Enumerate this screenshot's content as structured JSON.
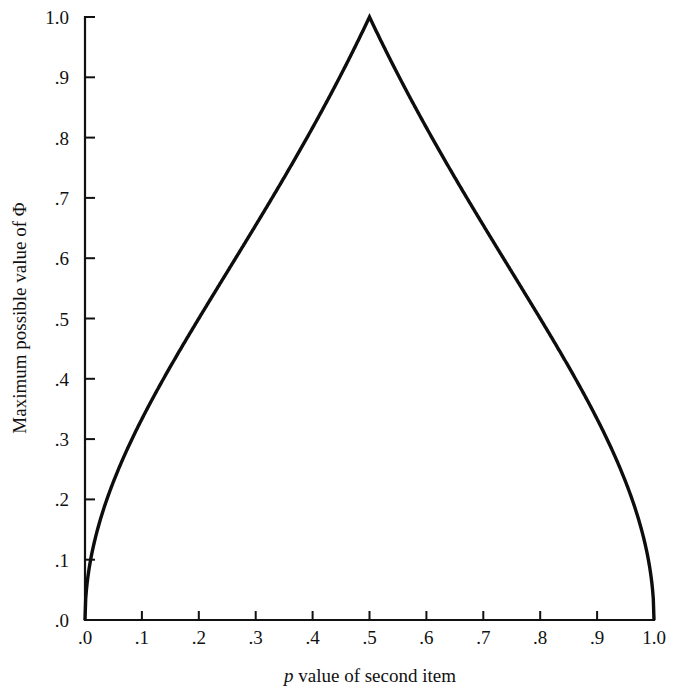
{
  "figure": {
    "background_color": "#ffffff",
    "line_color": "#0d0d0d",
    "axis_color": "#111111"
  },
  "chart_data": {
    "type": "line",
    "title": "",
    "xlabel": "p value of second item",
    "xlabel_italic_prefix": "p",
    "xlabel_rest": " value of second item",
    "ylabel": "Maximum possible value of Φ",
    "ylabel_text": "Maximum possible value of",
    "ylabel_symbol": "Φ",
    "xlim": [
      0.0,
      1.0
    ],
    "ylim": [
      0.0,
      1.0
    ],
    "grid": false,
    "legend": "none",
    "xticks": [
      0.0,
      0.1,
      0.2,
      0.3,
      0.4,
      0.5,
      0.6,
      0.7,
      0.8,
      0.9,
      1.0
    ],
    "xticklabels": [
      ".0",
      ".1",
      ".2",
      ".3",
      ".4",
      ".5",
      ".6",
      ".7",
      ".8",
      ".9",
      "1.0"
    ],
    "yticks": [
      0.0,
      0.1,
      0.2,
      0.3,
      0.4,
      0.5,
      0.6,
      0.7,
      0.8,
      0.9,
      1.0
    ],
    "yticklabels": [
      ".0",
      ".1",
      ".2",
      ".3",
      ".4",
      ".5",
      ".6",
      ".7",
      ".8",
      ".9",
      "1.0"
    ],
    "series": [
      {
        "name": "Maximum possible phi",
        "formula": "sqrt(p/(1-p)) for p<=0.5 ; sqrt((1-p)/p) for p>0.5",
        "x": [
          0.0,
          0.01,
          0.02,
          0.03,
          0.04,
          0.05,
          0.06,
          0.08,
          0.1,
          0.12,
          0.15,
          0.2,
          0.25,
          0.3,
          0.35,
          0.4,
          0.45,
          0.5,
          0.55,
          0.6,
          0.65,
          0.7,
          0.75,
          0.8,
          0.85,
          0.88,
          0.9,
          0.92,
          0.94,
          0.95,
          0.96,
          0.97,
          0.98,
          0.99,
          1.0
        ],
        "y": [
          0.0,
          0.101,
          0.143,
          0.176,
          0.204,
          0.229,
          0.253,
          0.295,
          0.333,
          0.369,
          0.42,
          0.5,
          0.577,
          0.655,
          0.734,
          0.816,
          0.905,
          1.0,
          0.905,
          0.816,
          0.734,
          0.655,
          0.577,
          0.5,
          0.42,
          0.369,
          0.333,
          0.295,
          0.253,
          0.229,
          0.204,
          0.176,
          0.143,
          0.101,
          0.0
        ]
      }
    ],
    "annotations": [
      {
        "label": "peak",
        "x": 0.5,
        "y": 1.0
      }
    ]
  }
}
